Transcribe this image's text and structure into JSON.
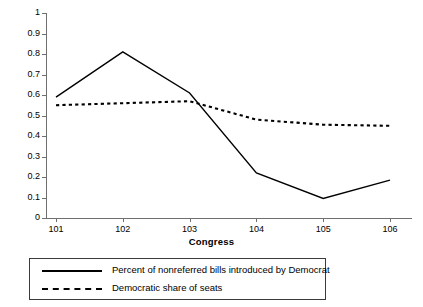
{
  "chart_data": {
    "type": "line",
    "title": "",
    "xlabel": "Congress",
    "ylabel": "",
    "categories": [
      "101",
      "102",
      "103",
      "104",
      "105",
      "106"
    ],
    "xlim": [
      101,
      106
    ],
    "ylim": [
      0,
      1
    ],
    "ytick_labels": [
      "1",
      "0.9",
      "0.8",
      "0.7",
      "0.6",
      "0.5",
      "0.4",
      "0.3",
      "0.2",
      "0.1",
      "0"
    ],
    "ytick_values": [
      1,
      0.9,
      0.8,
      0.7,
      0.6,
      0.5,
      0.4,
      0.3,
      0.2,
      0.1,
      0
    ],
    "grid": false,
    "legend_position": "bottom",
    "series": [
      {
        "name": "Percent of nonreferred bills introduced by Democrat",
        "style": "solid",
        "color": "#000000",
        "values": [
          0.59,
          0.81,
          0.61,
          0.22,
          0.095,
          0.185
        ]
      },
      {
        "name": "Democratic share of seats",
        "style": "dashed",
        "color": "#000000",
        "values": [
          0.55,
          0.56,
          0.57,
          0.48,
          0.455,
          0.45
        ]
      }
    ]
  },
  "axis": {
    "x_title": "Congress"
  },
  "legend": {
    "entries": [
      {
        "label": "Percent of nonreferred bills introduced by Democrat",
        "style": "solid"
      },
      {
        "label": "Democratic share of seats",
        "style": "dashed"
      }
    ]
  }
}
